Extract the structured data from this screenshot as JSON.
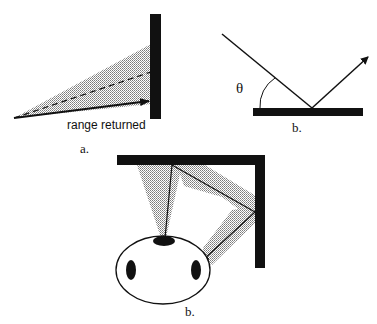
{
  "figure_a": {
    "caption": "a.",
    "label": "range returned"
  },
  "figure_b_top": {
    "caption": "b.",
    "angle_symbol": "θ"
  },
  "figure_b_bottom": {
    "caption": "b."
  },
  "colors": {
    "ink": "#111111",
    "stipple": "#9a9a9a",
    "background": "#ffffff"
  }
}
